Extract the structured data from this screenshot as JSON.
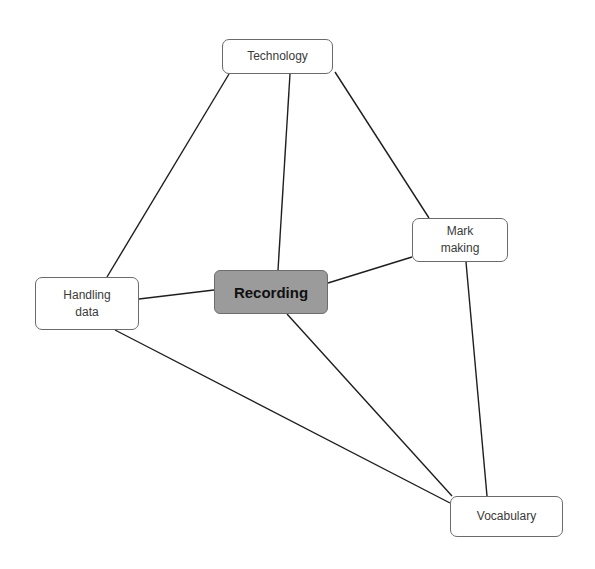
{
  "diagram": {
    "type": "concept-map",
    "background": "#ffffff",
    "central_fill": "#9b9b9b",
    "nodes": {
      "technology": {
        "label": "Technology",
        "x": 222,
        "y": 39,
        "w": 111,
        "h": 35
      },
      "recording": {
        "label": "Recording",
        "x": 214,
        "y": 270,
        "w": 114,
        "h": 44,
        "central": true
      },
      "handling_data": {
        "label": "Handling\ndata",
        "x": 35,
        "y": 277,
        "w": 104,
        "h": 53
      },
      "mark_making": {
        "label": "Mark\nmaking",
        "x": 412,
        "y": 218,
        "w": 96,
        "h": 44
      },
      "vocabulary": {
        "label": "Vocabulary",
        "x": 450,
        "y": 496,
        "w": 113,
        "h": 41
      }
    },
    "edges": [
      {
        "from": "technology",
        "to": "handling_data",
        "x1": 229,
        "y1": 74,
        "x2": 107,
        "y2": 277
      },
      {
        "from": "technology",
        "to": "recording",
        "x1": 290,
        "y1": 74,
        "x2": 278,
        "y2": 270
      },
      {
        "from": "technology",
        "to": "mark_making",
        "x1": 335,
        "y1": 72,
        "x2": 429,
        "y2": 218
      },
      {
        "from": "handling_data",
        "to": "recording",
        "x1": 139,
        "y1": 299,
        "x2": 214,
        "y2": 290
      },
      {
        "from": "recording",
        "to": "mark_making",
        "x1": 328,
        "y1": 283,
        "x2": 412,
        "y2": 257
      },
      {
        "from": "handling_data",
        "to": "vocabulary",
        "x1": 115,
        "y1": 330,
        "x2": 450,
        "y2": 503
      },
      {
        "from": "recording",
        "to": "vocabulary",
        "x1": 287,
        "y1": 314,
        "x2": 452,
        "y2": 496
      },
      {
        "from": "mark_making",
        "to": "vocabulary",
        "x1": 466,
        "y1": 262,
        "x2": 487,
        "y2": 496
      }
    ]
  }
}
